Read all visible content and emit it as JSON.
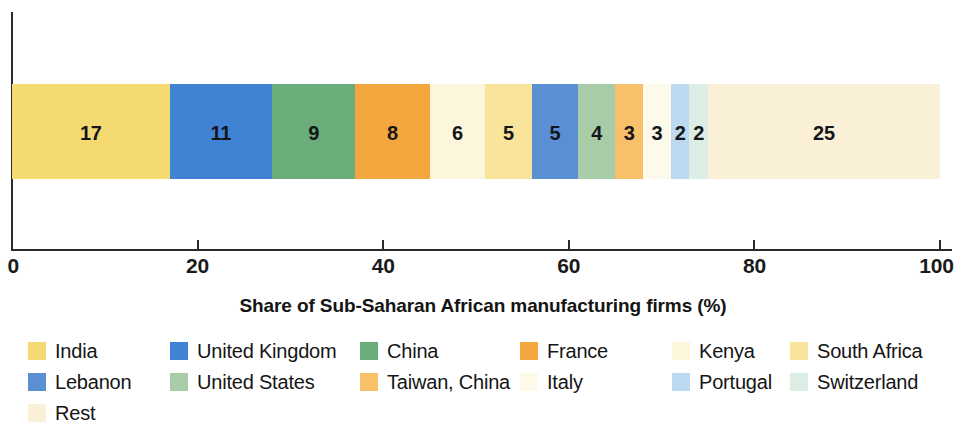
{
  "chart_data": {
    "type": "bar",
    "orientation": "horizontal",
    "stacked": true,
    "title": "",
    "xlabel": "Share of Sub-Saharan African manufacturing firms (%)",
    "ylabel": "",
    "xlim": [
      0,
      100
    ],
    "xticks": [
      0,
      20,
      40,
      60,
      80,
      100
    ],
    "xtick_labels": [
      "0",
      "20",
      "40",
      "60",
      "80",
      "100"
    ],
    "grid": false,
    "legend_position": "below",
    "categories": [
      ""
    ],
    "series": [
      {
        "name": "India",
        "values": [
          17
        ],
        "label": "17",
        "color": "#f5da71"
      },
      {
        "name": "United Kingdom",
        "values": [
          11
        ],
        "label": "11",
        "color": "#4083d4"
      },
      {
        "name": "China",
        "values": [
          9
        ],
        "label": "9",
        "color": "#6bae7c"
      },
      {
        "name": "France",
        "values": [
          8
        ],
        "label": "8",
        "color": "#f4a73f"
      },
      {
        "name": "Kenya",
        "values": [
          6
        ],
        "label": "6",
        "color": "#fbf6dc"
      },
      {
        "name": "South Africa",
        "values": [
          5
        ],
        "label": "5",
        "color": "#f8e49a"
      },
      {
        "name": "Lebanon",
        "values": [
          5
        ],
        "label": "5",
        "color": "#5b8fd4"
      },
      {
        "name": "United States",
        "values": [
          4
        ],
        "label": "4",
        "color": "#a8cba8"
      },
      {
        "name": "Taiwan, China",
        "values": [
          3
        ],
        "label": "3",
        "color": "#f8c069"
      },
      {
        "name": "Italy",
        "values": [
          3
        ],
        "label": "3",
        "color": "#fdfaea"
      },
      {
        "name": "Portugal",
        "values": [
          2
        ],
        "label": "2",
        "color": "#bdd9f2"
      },
      {
        "name": "Switzerland",
        "values": [
          2
        ],
        "label": "2",
        "color": "#dcede4"
      },
      {
        "name": "Rest",
        "values": [
          25
        ],
        "label": "25",
        "color": "#faf0d8"
      }
    ],
    "total": 100
  },
  "axis": {
    "x_title": "Share of Sub-Saharan African manufacturing firms (%)",
    "ticks": [
      {
        "value": "0"
      },
      {
        "value": "20"
      },
      {
        "value": "40"
      },
      {
        "value": "60"
      },
      {
        "value": "80"
      },
      {
        "value": "100"
      }
    ]
  },
  "legend": {
    "rows": [
      [
        {
          "label": "India",
          "color": "#f5da71"
        },
        {
          "label": "United Kingdom",
          "color": "#4083d4"
        },
        {
          "label": "China",
          "color": "#6bae7c"
        },
        {
          "label": "France",
          "color": "#f4a73f"
        },
        {
          "label": "Kenya",
          "color": "#fbf6dc"
        },
        {
          "label": "South Africa",
          "color": "#f8e49a"
        }
      ],
      [
        {
          "label": "Lebanon",
          "color": "#5b8fd4"
        },
        {
          "label": "United States",
          "color": "#a8cba8"
        },
        {
          "label": "Taiwan, China",
          "color": "#f8c069"
        },
        {
          "label": "Italy",
          "color": "#fdfaea"
        },
        {
          "label": "Portugal",
          "color": "#bdd9f2"
        },
        {
          "label": "Switzerland",
          "color": "#dcede4"
        }
      ],
      [
        {
          "label": "Rest",
          "color": "#faf0d8"
        }
      ]
    ]
  }
}
